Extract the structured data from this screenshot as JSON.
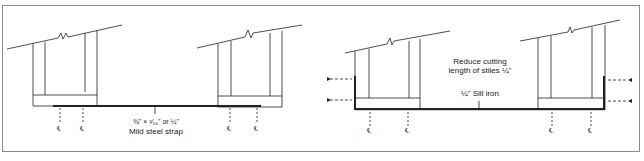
{
  "figure": {
    "left_panel": {
      "strap_dimension": "¾\" × ³⁄₁₆\" or ¼\"",
      "strap_label": "Mild steel strap",
      "centerline_symbol": "℄"
    },
    "right_panel": {
      "note_line1": "Reduce cutting",
      "note_line2": "length of stiles ¼\"",
      "sill_label": "¼\" Sill iron",
      "centerline_symbol": "℄"
    }
  },
  "colors": {
    "line": "#222222",
    "frame": "#8a8a8a",
    "background": "#ffffff"
  }
}
